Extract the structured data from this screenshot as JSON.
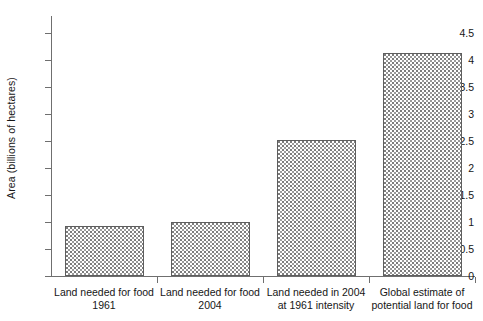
{
  "chart_data": {
    "type": "bar",
    "title": "",
    "subtitle": "",
    "xlabel": "",
    "ylabel": "Area (billions of hectares)",
    "categories": [
      "Land needed for food 1961",
      "Land needed for food 2004",
      "Land needed in 2004 at 1961 intensity",
      "Global estimate of potential land for food"
    ],
    "category_lines": [
      [
        "Land needed for food",
        "1961"
      ],
      [
        "Land needed for food",
        "2004"
      ],
      [
        "Land needed in 2004",
        "at 1961 intensity"
      ],
      [
        "Global estimate of",
        "potential land for food"
      ]
    ],
    "values": [
      0.92,
      1.0,
      2.52,
      4.13
    ],
    "ylim": [
      0,
      4.5
    ],
    "ytick_values": [
      0,
      0.5,
      1,
      1.5,
      2,
      2.5,
      3,
      3.5,
      4,
      4.5
    ],
    "ytick_labels": [
      "0",
      "0.5",
      "1",
      "1.5",
      "2",
      "2.5",
      "3",
      "3.5",
      "4",
      "4.5"
    ],
    "grid": false,
    "legend": false,
    "legend_position": "none",
    "bar_fill": "#ffffff",
    "bar_pattern": "dotted-stipple",
    "bar_border_color": "#5e5e5e",
    "axis_color": "#6f6f6f",
    "text_color": "#161616",
    "background": "#ffffff"
  }
}
